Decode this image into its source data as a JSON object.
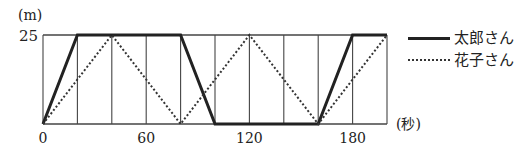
{
  "chart_data": {
    "type": "line",
    "title": "",
    "xlabel": "(秒)",
    "ylabel": "(m)",
    "xlim": [
      0,
      200
    ],
    "ylim": [
      0,
      25
    ],
    "x_ticks": [
      0,
      60,
      120,
      180
    ],
    "y_ticks": [
      25
    ],
    "x_gridlines": [
      0,
      20,
      40,
      60,
      80,
      100,
      120,
      140,
      160,
      180,
      200
    ],
    "grid": true,
    "legend_position": "right",
    "series": [
      {
        "name": "太郎さん",
        "style": "solid",
        "points": [
          [
            0,
            0
          ],
          [
            20,
            25
          ],
          [
            80,
            25
          ],
          [
            100,
            0
          ],
          [
            160,
            0
          ],
          [
            180,
            25
          ],
          [
            200,
            25
          ]
        ]
      },
      {
        "name": "花子さん",
        "style": "dotted",
        "points": [
          [
            0,
            0
          ],
          [
            40,
            25
          ],
          [
            80,
            0
          ],
          [
            120,
            25
          ],
          [
            160,
            0
          ],
          [
            200,
            25
          ]
        ]
      }
    ]
  },
  "axis": {
    "y_unit": "(m)",
    "x_unit": "(秒)",
    "y_top_label": "25",
    "x_labels": [
      "0",
      "60",
      "120",
      "180"
    ]
  },
  "legend": {
    "items": [
      {
        "label": "太郎さん",
        "style": "solid"
      },
      {
        "label": "花子さん",
        "style": "dotted"
      }
    ]
  }
}
